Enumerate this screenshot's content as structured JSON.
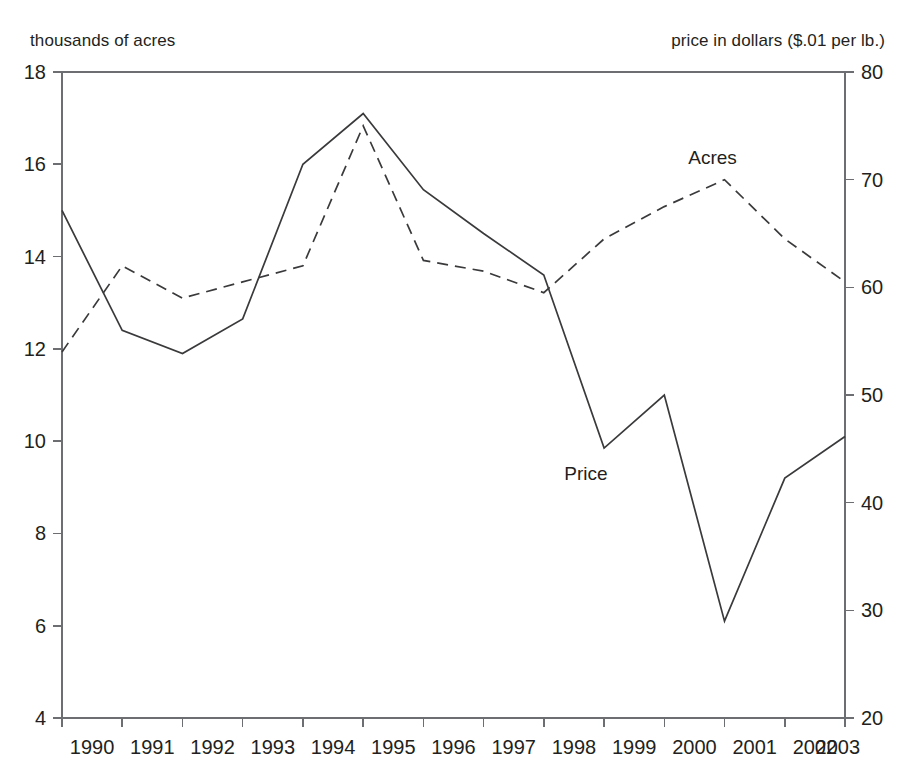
{
  "captions": {
    "left_axis_caption": "thousands of acres",
    "right_axis_caption": "price in dollars ($.01 per lb.)"
  },
  "chart_data": {
    "type": "line",
    "title": "",
    "subtitle": "",
    "xlabel": "",
    "ylabel": "thousands of acres",
    "y2label": "price in dollars ($.01 per lb.)",
    "grid": false,
    "legend_position": "inline-annotation",
    "x": [
      1990,
      1991,
      1992,
      1993,
      1994,
      1995,
      1996,
      1997,
      1998,
      1999,
      2000,
      2001,
      2002,
      2003
    ],
    "categories": [
      "1990",
      "1991",
      "1992",
      "1993",
      "1994",
      "1995",
      "1996",
      "1997",
      "1998",
      "1999",
      "2000",
      "2001",
      "2002",
      "2003"
    ],
    "xlim": [
      1990,
      2003
    ],
    "ylim": [
      4,
      18
    ],
    "yticks": [
      4,
      6,
      8,
      10,
      12,
      14,
      16,
      18
    ],
    "ytick_labels": [
      "4",
      "6",
      "8",
      "10",
      "12",
      "14",
      "16",
      "18"
    ],
    "y2lim": [
      20,
      80
    ],
    "y2ticks": [
      20,
      30,
      40,
      50,
      60,
      70,
      80
    ],
    "y2tick_labels": [
      "20",
      "30",
      "40",
      "50",
      "60",
      "70",
      "80"
    ],
    "series": [
      {
        "name": "Price",
        "axis": "left",
        "style": "solid",
        "color": "#3a3a3c",
        "label_text": "Price",
        "label_x": 1998.7,
        "label_y": 9.15,
        "values": [
          15.0,
          12.4,
          11.9,
          12.65,
          16.0,
          17.1,
          15.45,
          14.5,
          13.6,
          9.85,
          11.0,
          6.1,
          9.2,
          10.1
        ]
      },
      {
        "name": "Acres",
        "axis": "right",
        "style": "dashed",
        "color": "#3a3a3c",
        "label_text": "Acres",
        "label_x": 2000.8,
        "label_y": 71.5,
        "values": [
          54.0,
          62.0,
          59.0,
          60.5,
          62.0,
          75.0,
          62.5,
          61.5,
          59.5,
          64.5,
          67.5,
          70.0,
          64.5,
          60.5
        ]
      }
    ]
  }
}
